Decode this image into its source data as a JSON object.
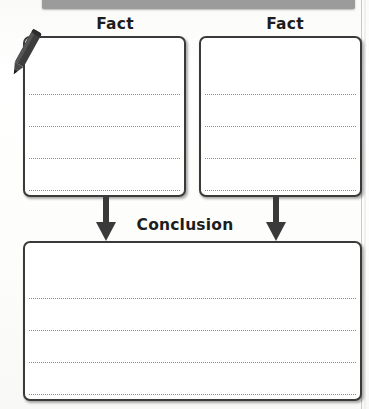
{
  "worksheet": {
    "type": "graphic-organizer",
    "top_banner": {
      "present": true,
      "color": "#9b9b9b"
    },
    "pencil_icon": {
      "name": "pencil-icon",
      "color": "#3b3b3b"
    },
    "boxes": [
      {
        "id": "fact-1",
        "label": "Fact",
        "lines": 4
      },
      {
        "id": "fact-2",
        "label": "Fact",
        "lines": 4
      },
      {
        "id": "conclusion",
        "label": "Conclusion",
        "lines": 4
      }
    ],
    "labels": {
      "fact_left": "Fact",
      "fact_right": "Fact",
      "conclusion": "Conclusion"
    },
    "arrows": [
      {
        "id": "arrow-left",
        "direction": "down",
        "from": "fact-1",
        "to": "conclusion"
      },
      {
        "id": "arrow-right",
        "direction": "down",
        "from": "fact-2",
        "to": "conclusion"
      }
    ],
    "colors": {
      "box_border": "#3a3a3a",
      "rule_line": "#8c8c8c",
      "text": "#1d1d1d",
      "banner": "#9b9b9b",
      "paper": "#fdfdfc"
    }
  }
}
